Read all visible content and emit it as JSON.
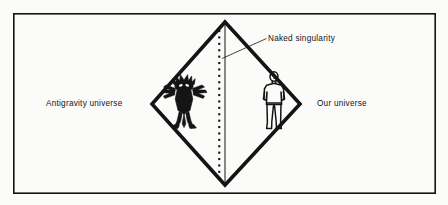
{
  "figure": {
    "background_color": "#fbfbfa",
    "ink_color": "#141414",
    "frame": {
      "name": "outer-border",
      "x": 13,
      "y": 13,
      "width": 423,
      "height": 181,
      "stroke_width": 1.6
    },
    "diamond": {
      "name": "diamond-outline",
      "top": [
        225,
        22
      ],
      "right": [
        300,
        104
      ],
      "bottom": [
        225,
        185
      ],
      "left": [
        152,
        104
      ],
      "stroke_width": 3.4
    },
    "singularity_line": {
      "name": "singularity-vertical-line",
      "x": 225,
      "y_top": 22,
      "y_bottom": 185,
      "stroke_width": 1.0
    },
    "dot_column": {
      "name": "singularity-dot-column",
      "x": 219,
      "y_start": 30,
      "y_end": 180,
      "dot_size": 2.0,
      "spacing": 6.4,
      "count": 24
    },
    "leader_line": {
      "name": "naked-singularity-leader",
      "from": [
        222,
        58
      ],
      "to": [
        266,
        39
      ],
      "stroke_width": 0.8
    }
  },
  "labels": {
    "antigravity_universe": "Antigravity universe",
    "our_universe": "Our universe",
    "naked_singularity": "Naked singularity"
  },
  "figures": {
    "antigravity_being": {
      "name": "antigravity-creature-silhouette",
      "description": "filled black alien humanoid with splayed limbs",
      "center_x": 184,
      "center_y": 103
    },
    "human": {
      "name": "human-figure-outline",
      "description": "outline drawing of standing person",
      "center_x": 274,
      "center_y": 102
    }
  }
}
